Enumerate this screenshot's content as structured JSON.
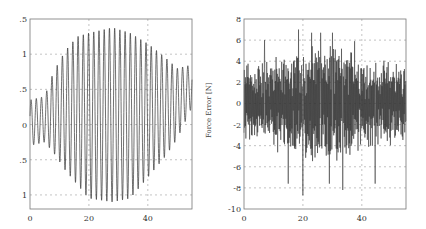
{
  "chart_data": [
    {
      "type": "line",
      "title": "",
      "xlabel": "",
      "ylabel": "",
      "xlim": [
        0,
        55
      ],
      "ylim": [
        -1.2,
        1.5
      ],
      "xticks": [
        0,
        20,
        40
      ],
      "xtick_labels": [
        "0",
        "20",
        "40"
      ],
      "yticks": [
        1.5,
        1,
        0.5,
        0,
        -0.5,
        -1
      ],
      "ytick_labels": [
        ".5",
        "1",
        ".5",
        "0",
        ".5",
        "1"
      ],
      "grid": true,
      "description": "Oscillating signal with growing then shrinking envelope, peak amplitude ~1.35 near x=28, ~30 cycles",
      "series": [
        {
          "name": "signal",
          "envelope_points": [
            {
              "x": 0,
              "y_max": 0.35,
              "y_min": -0.3
            },
            {
              "x": 5,
              "y_max": 0.4,
              "y_min": -0.25
            },
            {
              "x": 8,
              "y_max": 0.75,
              "y_min": -0.4
            },
            {
              "x": 12,
              "y_max": 1.05,
              "y_min": -0.65
            },
            {
              "x": 16,
              "y_max": 1.25,
              "y_min": -0.85
            },
            {
              "x": 20,
              "y_max": 1.3,
              "y_min": -1.05
            },
            {
              "x": 28,
              "y_max": 1.38,
              "y_min": -1.1
            },
            {
              "x": 34,
              "y_max": 1.3,
              "y_min": -1.05
            },
            {
              "x": 40,
              "y_max": 1.15,
              "y_min": -0.75
            },
            {
              "x": 46,
              "y_max": 0.95,
              "y_min": -0.45
            },
            {
              "x": 50,
              "y_max": 0.8,
              "y_min": -0.2
            },
            {
              "x": 55,
              "y_max": 0.85,
              "y_min": 0.25
            }
          ],
          "cycles": 31
        }
      ]
    },
    {
      "type": "line",
      "title": "",
      "xlabel": "",
      "ylabel": "Force Error [N]",
      "xlim": [
        0,
        55
      ],
      "ylim": [
        -10,
        8
      ],
      "xticks": [
        0,
        20,
        40
      ],
      "xtick_labels": [
        "0",
        "20",
        "40"
      ],
      "yticks": [
        8,
        6,
        4,
        2,
        0,
        -2,
        -4,
        -6,
        -8,
        -10
      ],
      "ytick_labels": [
        "8",
        "6",
        "4",
        "2",
        "0",
        "-2",
        "-4",
        "-6",
        "-8",
        "-10"
      ],
      "grid": true,
      "description": "Noisy high-frequency force error signal, mostly within -6..6 N, peaks ~7 and ~-8.7",
      "series": [
        {
          "name": "force_error",
          "peaks": [
            {
              "x": 18.5,
              "y": 7.0
            },
            {
              "x": 20.0,
              "y": -8.7
            },
            {
              "x": 15.0,
              "y": -7.6
            },
            {
              "x": 29.0,
              "y": -7.6
            },
            {
              "x": 33.5,
              "y": -8.2
            },
            {
              "x": 44.5,
              "y": -7.6
            },
            {
              "x": 23.0,
              "y": 6.7
            },
            {
              "x": 26.0,
              "y": 6.7
            },
            {
              "x": 30.0,
              "y": 6.7
            },
            {
              "x": 7.0,
              "y": 6.0
            },
            {
              "x": 37.5,
              "y": 5.9
            }
          ],
          "typical_range": [
            -5,
            5
          ]
        }
      ]
    }
  ]
}
